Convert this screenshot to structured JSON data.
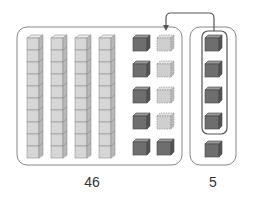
{
  "diagram": {
    "left_group": {
      "label": "46",
      "tens_rods": 4,
      "cubes_per_rod": 10,
      "dark_ones": 6,
      "dashed_ones": 4
    },
    "right_group": {
      "label": "5",
      "ones": 5,
      "circled_ones": 4
    },
    "arrow": "moves 4 circled ones from right group into left group",
    "colors": {
      "rod_face": "#d6d6d6",
      "rod_top": "#eeeeee",
      "rod_side": "#b8b8b8",
      "cube_face": "#6e6e6e",
      "cube_top": "#9a9a9a",
      "cube_side": "#555555",
      "dashed_face": "#cfcfcf",
      "border": "#888888",
      "arrow": "#555555"
    }
  }
}
